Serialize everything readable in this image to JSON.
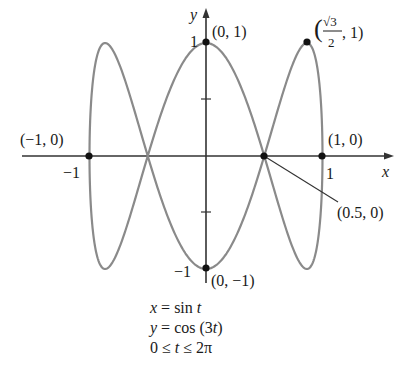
{
  "chart_data": {
    "type": "line",
    "subtype": "parametric",
    "title": "",
    "xlabel": "x",
    "ylabel": "y",
    "xlim": [
      -1,
      1
    ],
    "ylim": [
      -1,
      1
    ],
    "grid": false,
    "x_ticks": [
      {
        "value": -1,
        "label": "-1"
      },
      {
        "value": 1,
        "label": "1"
      }
    ],
    "y_ticks": [
      {
        "value": 1,
        "label": "1"
      },
      {
        "value": 0.5,
        "label": ""
      },
      {
        "value": -0.5,
        "label": ""
      },
      {
        "value": -1,
        "label": "-1"
      }
    ],
    "series": [
      {
        "name": "curve",
        "x_expr": "sin t",
        "y_expr": "cos (3t)",
        "t_range": [
          0,
          6.283185307
        ],
        "color": "#8a8a8a"
      }
    ],
    "highlighted_points": [
      {
        "x": 0,
        "y": 1,
        "label": "(0, 1)"
      },
      {
        "x": 0.866,
        "y": 1,
        "label": "(√3/2, 1)"
      },
      {
        "x": -1,
        "y": 0,
        "label": "(−1, 0)"
      },
      {
        "x": 1,
        "y": 0,
        "label": "(1, 0)"
      },
      {
        "x": 0.5,
        "y": 0,
        "label": "(0.5, 0)"
      },
      {
        "x": 0,
        "y": -1,
        "label": "(0, −1)"
      }
    ]
  },
  "labels": {
    "x_axis": "x",
    "y_axis": "y",
    "tick_x_neg1": "−1",
    "tick_x_pos1": "1",
    "tick_y_pos1": "1",
    "tick_y_neg1": "−1",
    "pt_0_1": "(0, 1)",
    "pt_sqrt3": {
      "num": "√3",
      "den": "2",
      "rest": ", 1)"
    },
    "pt_neg1_0": "(−1, 0)",
    "pt_1_0": "(1, 0)",
    "pt_05_0": "(0.5, 0)",
    "pt_0_neg1": "(0, −1)"
  },
  "equations": {
    "line1_var": "x",
    "line1_rest": " = sin ",
    "line1_t": "t",
    "line2_var": "y",
    "line2_rest": " = cos (3",
    "line2_t": "t",
    "line2_end": ")",
    "line3_start": "0 ≤ ",
    "line3_t": "t",
    "line3_end": " ≤ 2π"
  }
}
